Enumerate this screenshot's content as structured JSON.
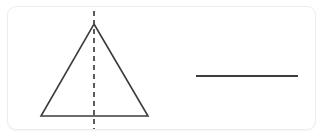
{
  "panel": {
    "background_color": "#ffffff",
    "border_color": "#eceded",
    "corner_radius": 9
  },
  "figure": {
    "title": "",
    "stroke_color": "#3c3c3c",
    "dashed_stroke_color": "#4a4a4a",
    "shapes": [
      {
        "name": "isosceles-triangle",
        "type": "polygon",
        "points": "94,24 148,116 41,116",
        "stroke_width": 1.6,
        "fill": "none",
        "label": ""
      },
      {
        "name": "symmetry-axis",
        "type": "dashed-line",
        "x1": 94,
        "y1": 11,
        "x2": 94,
        "y2": 129,
        "stroke_width": 1.8,
        "dash_pattern": "5 4",
        "label": ""
      },
      {
        "name": "horizontal-line-segment",
        "type": "line",
        "x1": 196,
        "y1": 76,
        "x2": 298,
        "y2": 76,
        "stroke_width": 1.8,
        "label": ""
      }
    ]
  }
}
